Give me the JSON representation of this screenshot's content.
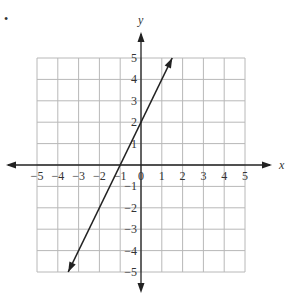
{
  "chart_data": {
    "type": "line",
    "title": "",
    "xlabel": "x",
    "ylabel": "y",
    "xlim": [
      -5,
      5
    ],
    "ylim": [
      -5,
      5
    ],
    "grid": true,
    "x_ticks": [
      "-5",
      "-4",
      "-3",
      "-2",
      "-1",
      "0",
      "1",
      "2",
      "3",
      "4",
      "5"
    ],
    "y_ticks": [
      "5",
      "4",
      "3",
      "2",
      "1",
      "-1",
      "-2",
      "-3",
      "-4",
      "-5"
    ],
    "series": [
      {
        "name": "line",
        "equation": "y = 2x + 2",
        "x": [
          -3.5,
          1.5
        ],
        "y": [
          -5,
          5
        ],
        "arrows": "both"
      }
    ]
  },
  "bullet": "•"
}
